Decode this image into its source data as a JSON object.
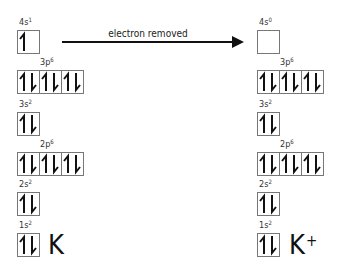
{
  "arrow": {
    "label": "electron removed"
  },
  "left": {
    "element": "K",
    "charge": "",
    "orbitals": [
      {
        "name": "4s",
        "shell": "4s",
        "exp": "1",
        "boxes": [
          [
            "up"
          ]
        ]
      },
      {
        "name": "3p",
        "shell": "3p",
        "exp": "6",
        "boxes": [
          [
            "up",
            "down"
          ],
          [
            "up",
            "down"
          ],
          [
            "up",
            "down"
          ]
        ]
      },
      {
        "name": "3s",
        "shell": "3s",
        "exp": "2",
        "boxes": [
          [
            "up",
            "down"
          ]
        ]
      },
      {
        "name": "2p",
        "shell": "2p",
        "exp": "6",
        "boxes": [
          [
            "up",
            "down"
          ],
          [
            "up",
            "down"
          ],
          [
            "up",
            "down"
          ]
        ]
      },
      {
        "name": "2s",
        "shell": "2s",
        "exp": "2",
        "boxes": [
          [
            "up",
            "down"
          ]
        ]
      },
      {
        "name": "1s",
        "shell": "1s",
        "exp": "2",
        "boxes": [
          [
            "up",
            "down"
          ]
        ]
      }
    ]
  },
  "right": {
    "element": "K",
    "charge": "+",
    "orbitals": [
      {
        "name": "4s",
        "shell": "4s",
        "exp": "0",
        "boxes": [
          []
        ]
      },
      {
        "name": "3p",
        "shell": "3p",
        "exp": "6",
        "boxes": [
          [
            "up",
            "down"
          ],
          [
            "up",
            "down"
          ],
          [
            "up",
            "down"
          ]
        ]
      },
      {
        "name": "3s",
        "shell": "3s",
        "exp": "2",
        "boxes": [
          [
            "up",
            "down"
          ]
        ]
      },
      {
        "name": "2p",
        "shell": "2p",
        "exp": "6",
        "boxes": [
          [
            "up",
            "down"
          ],
          [
            "up",
            "down"
          ],
          [
            "up",
            "down"
          ]
        ]
      },
      {
        "name": "2s",
        "shell": "2s",
        "exp": "2",
        "boxes": [
          [
            "up",
            "down"
          ]
        ]
      },
      {
        "name": "1s",
        "shell": "1s",
        "exp": "2",
        "boxes": [
          [
            "up",
            "down"
          ]
        ]
      }
    ]
  },
  "icons": {
    "up": "half-arrow-up-icon",
    "down": "half-arrow-down-icon"
  },
  "colors": {
    "box_border": "#777777",
    "text": "#1a1a1a"
  }
}
